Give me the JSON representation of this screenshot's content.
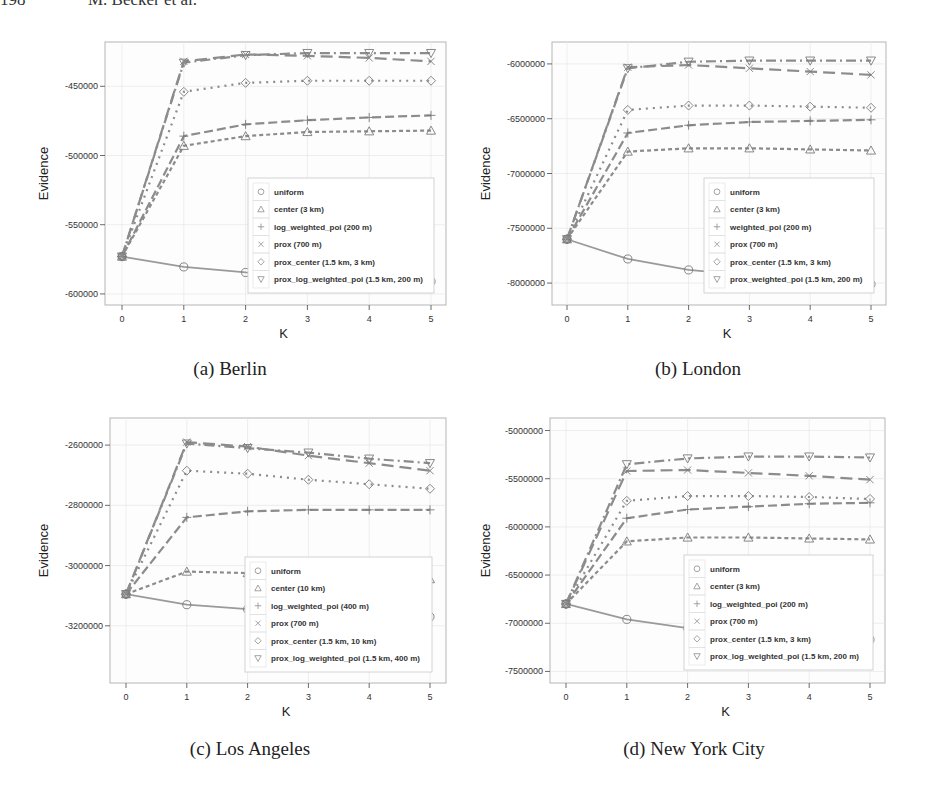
{
  "header": {
    "page_number": "198",
    "author": "M. Becker et al."
  },
  "captions": {
    "a": "(a) Berlin",
    "b": "(b) London",
    "c": "(c) Los Angeles",
    "d": "(d) New York City"
  },
  "colors": {
    "series_line": "#8c8c8c",
    "uniform_line": "#9a9a9a",
    "grid": "#e6e6e6",
    "frame": "#b5b5b5",
    "legend_border": "#c8c8c8"
  },
  "chart_data": [
    {
      "id": "berlin",
      "type": "line",
      "title": "(a) Berlin",
      "xlabel": "K",
      "ylabel": "Evidence",
      "x": [
        0,
        1,
        2,
        3,
        4,
        5
      ],
      "xticks": [
        "0",
        "1",
        "2",
        "3",
        "4",
        "5"
      ],
      "yticks": [
        -450000,
        -500000,
        -550000,
        -600000
      ],
      "ytick_labels": [
        "-450000",
        "-500000",
        "-550000",
        "-600000"
      ],
      "ylim": [
        -608000,
        -418000
      ],
      "grid": true,
      "legend_position": "lower right",
      "series": [
        {
          "name": "uniform",
          "marker": "circle",
          "dash": "solid",
          "values": [
            -573000,
            -580500,
            -584500,
            -587000,
            -589000,
            -591000
          ]
        },
        {
          "name": "center (3 km)",
          "marker": "triangle-up",
          "dash": "4,3",
          "values": [
            -573000,
            -493000,
            -486000,
            -483000,
            -482500,
            -482000
          ]
        },
        {
          "name": "log_weighted_poi (200 m)",
          "marker": "plus",
          "dash": "9,4",
          "values": [
            -573000,
            -486000,
            -477500,
            -474500,
            -472500,
            -471000
          ]
        },
        {
          "name": "prox (700 m)",
          "marker": "x",
          "dash": "12,6",
          "values": [
            -573000,
            -432000,
            -427000,
            -428000,
            -429500,
            -432000
          ]
        },
        {
          "name": "prox_center (1.5 km, 3 km)",
          "marker": "diamond",
          "dash": "2,5",
          "values": [
            -573000,
            -454000,
            -447500,
            -446000,
            -446000,
            -446000
          ]
        },
        {
          "name": "prox_log_weighted_poi (1.5 km, 200 m)",
          "marker": "triangle-down",
          "dash": "10,4,2,4",
          "values": [
            -573000,
            -433000,
            -427500,
            -426000,
            -426000,
            -426000
          ]
        }
      ]
    },
    {
      "id": "london",
      "type": "line",
      "title": "(b) London",
      "xlabel": "K",
      "ylabel": "Evidence",
      "x": [
        0,
        1,
        2,
        3,
        4,
        5
      ],
      "xticks": [
        "0",
        "1",
        "2",
        "3",
        "4",
        "5"
      ],
      "yticks": [
        -6000000,
        -6500000,
        -7000000,
        -7500000,
        -8000000
      ],
      "ytick_labels": [
        "-6000000",
        "-6500000",
        "-7000000",
        "-7500000",
        "-8000000"
      ],
      "ylim": [
        -8200000,
        -5800000
      ],
      "grid": true,
      "legend_position": "lower right",
      "series": [
        {
          "name": "uniform",
          "marker": "circle",
          "dash": "solid",
          "values": [
            -7600000,
            -7780000,
            -7880000,
            -7930000,
            -7970000,
            -8010000
          ]
        },
        {
          "name": "center (3 km)",
          "marker": "triangle-up",
          "dash": "4,3",
          "values": [
            -7600000,
            -6800000,
            -6770000,
            -6770000,
            -6780000,
            -6790000
          ]
        },
        {
          "name": "weighted_poi (200 m)",
          "marker": "plus",
          "dash": "9,4",
          "values": [
            -7600000,
            -6630000,
            -6560000,
            -6530000,
            -6520000,
            -6510000
          ]
        },
        {
          "name": "prox (700 m)",
          "marker": "x",
          "dash": "12,6",
          "values": [
            -7600000,
            -6030000,
            -6010000,
            -6040000,
            -6070000,
            -6100000
          ]
        },
        {
          "name": "prox_center (1.5 km, 3 km)",
          "marker": "diamond",
          "dash": "2,5",
          "values": [
            -7600000,
            -6420000,
            -6380000,
            -6380000,
            -6390000,
            -6400000
          ]
        },
        {
          "name": "prox_weighted_poi (1.5 km, 200 m)",
          "marker": "triangle-down",
          "dash": "10,4,2,4",
          "values": [
            -7600000,
            -6040000,
            -5980000,
            -5970000,
            -5970000,
            -5970000
          ]
        }
      ]
    },
    {
      "id": "los_angeles",
      "type": "line",
      "title": "(c) Los Angeles",
      "xlabel": "K",
      "ylabel": "Evidence",
      "x": [
        0,
        1,
        2,
        3,
        4,
        5
      ],
      "xticks": [
        "0",
        "1",
        "2",
        "3",
        "4",
        "5"
      ],
      "yticks": [
        -2600000,
        -2800000,
        -3000000,
        -3200000
      ],
      "ytick_labels": [
        "-2600000",
        "-2800000",
        "-3000000",
        "-3200000"
      ],
      "ylim": [
        -3390000,
        -2510000
      ],
      "grid": true,
      "legend_position": "lower right",
      "series": [
        {
          "name": "uniform",
          "marker": "circle",
          "dash": "solid",
          "values": [
            -3095000,
            -3130000,
            -3145000,
            -3155000,
            -3163000,
            -3170000
          ]
        },
        {
          "name": "center (10 km)",
          "marker": "triangle-up",
          "dash": "4,3",
          "values": [
            -3095000,
            -3020000,
            -3025000,
            -3030000,
            -3038000,
            -3045000
          ]
        },
        {
          "name": "log_weighted_poi (400 m)",
          "marker": "plus",
          "dash": "9,4",
          "values": [
            -3095000,
            -2840000,
            -2820000,
            -2815000,
            -2815000,
            -2815000
          ]
        },
        {
          "name": "prox (700 m)",
          "marker": "x",
          "dash": "12,6",
          "values": [
            -3095000,
            -2590000,
            -2605000,
            -2635000,
            -2660000,
            -2685000
          ]
        },
        {
          "name": "prox_center (1.5 km, 10 km)",
          "marker": "diamond",
          "dash": "2,5",
          "values": [
            -3095000,
            -2685000,
            -2695000,
            -2715000,
            -2730000,
            -2745000
          ]
        },
        {
          "name": "prox_log_weighted_poi (1.5 km, 400 m)",
          "marker": "triangle-down",
          "dash": "10,4,2,4",
          "values": [
            -3095000,
            -2595000,
            -2610000,
            -2625000,
            -2645000,
            -2660000
          ]
        }
      ]
    },
    {
      "id": "new_york_city",
      "type": "line",
      "title": "(d) New York City",
      "xlabel": "K",
      "ylabel": "Evidence",
      "x": [
        0,
        1,
        2,
        3,
        4,
        5
      ],
      "xticks": [
        "0",
        "1",
        "2",
        "3",
        "4",
        "5"
      ],
      "yticks": [
        -5000000,
        -5500000,
        -6000000,
        -6500000,
        -7000000,
        -7500000
      ],
      "ytick_labels": [
        "-5000000",
        "-5500000",
        "-6000000",
        "-6500000",
        "-7000000",
        "-7500000"
      ],
      "ylim": [
        -7620000,
        -4870000
      ],
      "grid": true,
      "legend_position": "lower right",
      "series": [
        {
          "name": "uniform",
          "marker": "circle",
          "dash": "solid",
          "values": [
            -6800000,
            -6960000,
            -7050000,
            -7110000,
            -7150000,
            -7170000
          ]
        },
        {
          "name": "center (3 km)",
          "marker": "triangle-up",
          "dash": "4,3",
          "values": [
            -6800000,
            -6150000,
            -6110000,
            -6110000,
            -6120000,
            -6130000
          ]
        },
        {
          "name": "log_weighted_poi (200 m)",
          "marker": "plus",
          "dash": "9,4",
          "values": [
            -6800000,
            -5910000,
            -5820000,
            -5790000,
            -5760000,
            -5750000
          ]
        },
        {
          "name": "prox (700 m)",
          "marker": "x",
          "dash": "12,6",
          "values": [
            -6800000,
            -5420000,
            -5410000,
            -5440000,
            -5470000,
            -5510000
          ]
        },
        {
          "name": "prox_center (1.5 km, 3 km)",
          "marker": "diamond",
          "dash": "2,5",
          "values": [
            -6800000,
            -5730000,
            -5680000,
            -5680000,
            -5690000,
            -5710000
          ]
        },
        {
          "name": "prox_log_weighted_poi (1.5 km, 200 m)",
          "marker": "triangle-down",
          "dash": "10,4,2,4",
          "values": [
            -6800000,
            -5350000,
            -5290000,
            -5270000,
            -5270000,
            -5280000
          ]
        }
      ]
    }
  ],
  "layout": [
    {
      "left": 0,
      "top": 0,
      "frame": [
        105,
        42,
        446,
        305
      ],
      "xpix": [
        122,
        431
      ],
      "legend": [
        248,
        178,
        434,
        293
      ],
      "ylabel_x": 48,
      "caption_x": 152,
      "caption_y": 356
    },
    {
      "left": 0,
      "top": 0,
      "frame": [
        552,
        42,
        886,
        305
      ],
      "xpix": [
        567,
        871
      ],
      "legend": [
        704,
        178,
        874,
        293
      ],
      "ylabel_x": 490,
      "caption_x": 612,
      "caption_y": 356
    },
    {
      "left": 0,
      "top": 0,
      "frame": [
        110,
        418,
        446,
        683
      ],
      "xpix": [
        126,
        430
      ],
      "legend": [
        245,
        557,
        432,
        672
      ],
      "ylabel_x": 48,
      "caption_x": 152,
      "caption_y": 744
    },
    {
      "left": 0,
      "top": 0,
      "frame": [
        550,
        418,
        885,
        683
      ],
      "xpix": [
        566,
        870
      ],
      "legend": [
        684,
        555,
        873,
        670
      ],
      "ylabel_x": 490,
      "caption_x": 612,
      "caption_y": 744
    }
  ]
}
